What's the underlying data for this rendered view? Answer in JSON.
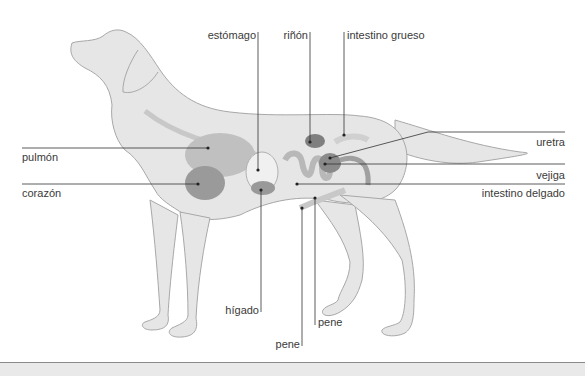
{
  "diagram": {
    "labels": {
      "estomago": "estómago",
      "rinon": "riñón",
      "intestino_grueso": "intestino grueso",
      "uretra": "uretra",
      "pulmon": "pulmón",
      "vejiga": "vejiga",
      "corazon": "corazón",
      "intestino_delgado": "intestino delgado",
      "higado": "hígado",
      "pene_1": "pene",
      "pene_2": "pene"
    },
    "colors": {
      "body_fill": "#e6e6e6",
      "outline": "#a8a8a8",
      "organ_dark": "#8f8f8f",
      "organ_mid": "#b4b4b4",
      "organ_light": "#d2d2d2",
      "leader_line": "#333333"
    }
  }
}
